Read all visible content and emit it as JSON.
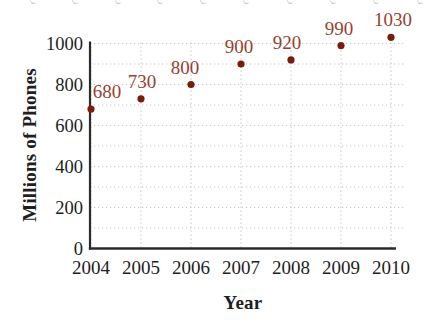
{
  "chart_data": {
    "type": "scatter",
    "title": "",
    "xlabel": "Year",
    "ylabel": "Millions of Phones",
    "x": [
      2004,
      2005,
      2006,
      2007,
      2008,
      2009,
      2010
    ],
    "values": [
      680,
      730,
      800,
      900,
      920,
      990,
      1030
    ],
    "point_labels": [
      "680",
      "730",
      "800",
      "900",
      "920",
      "990",
      "1030"
    ],
    "x_tick_labels": [
      "2004",
      "2005",
      "2006",
      "2007",
      "2008",
      "2009",
      "2010"
    ],
    "y_ticks": [
      0,
      200,
      400,
      600,
      800,
      1000
    ],
    "y_tick_labels": [
      "0",
      "200",
      "400",
      "600",
      "800",
      "1000"
    ],
    "ylim": [
      0,
      1050
    ],
    "grid": {
      "x": "every year",
      "y": "every 100 units",
      "style": "dotted light gray"
    },
    "legend": "none",
    "marker": "filled-circle",
    "label_dx": [
      16,
      1,
      -6,
      -2,
      -4,
      -2,
      2
    ],
    "colors": {
      "point": "#7a1c0c",
      "point_label": "#954231",
      "axis": "#2b2b2b",
      "tick_text": "#1e1e1e",
      "grid": "#c6c6c6",
      "background": "#ffffff"
    }
  }
}
